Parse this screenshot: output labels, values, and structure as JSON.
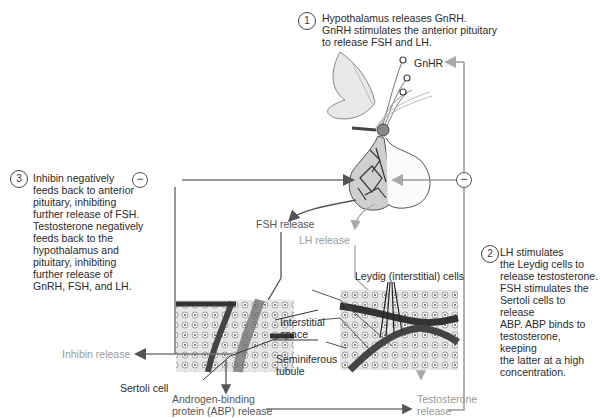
{
  "steps": [
    {
      "number": "1",
      "text": "Hypothalamus releases GnRH.\nGnRH stimulates the anterior pituitary\nto release FSH and LH."
    },
    {
      "number": "2",
      "text": "LH stimulates\nthe Leydig cells to\nrelease testosterone.\nFSH stimulates the\nSertoli cells to release\nABP. ABP binds to\ntestosterone, keeping\nthe latter at a high\nconcentration."
    },
    {
      "number": "3",
      "text": "Inhibin negatively\nfeeds back to anterior\npituitary, inhibiting\nfurther release of FSH.\nTestosterone negatively\nfeeds back to the\nhypothalamus and\npituitary, inhibiting\nfurther release of\nGnRH, FSH, and LH."
    }
  ],
  "labels": {
    "gnhr": "GnHR",
    "fsh_release": "FSH release",
    "lh_release": "LH release",
    "leydig_cells": "Leydig (interstitial) cells",
    "interstitial_space": "Interstitial\nspace",
    "seminiferous_tubule": "Seminiferous\ntubule",
    "inhibin_release": "Inhibin release",
    "sertoli_cell": "Sertoli cell",
    "abp_release": "Androgen-binding\nprotein (ABP) release",
    "testosterone_release": "Testosterone\nrelease"
  },
  "feedback_symbols": {
    "left": "−",
    "right": "−"
  },
  "colors": {
    "dark_arrow": "#555555",
    "light_arrow": "#aaaaaa",
    "tissue_dark": "#3a3a3a",
    "tissue_light": "#d8d8d8"
  }
}
